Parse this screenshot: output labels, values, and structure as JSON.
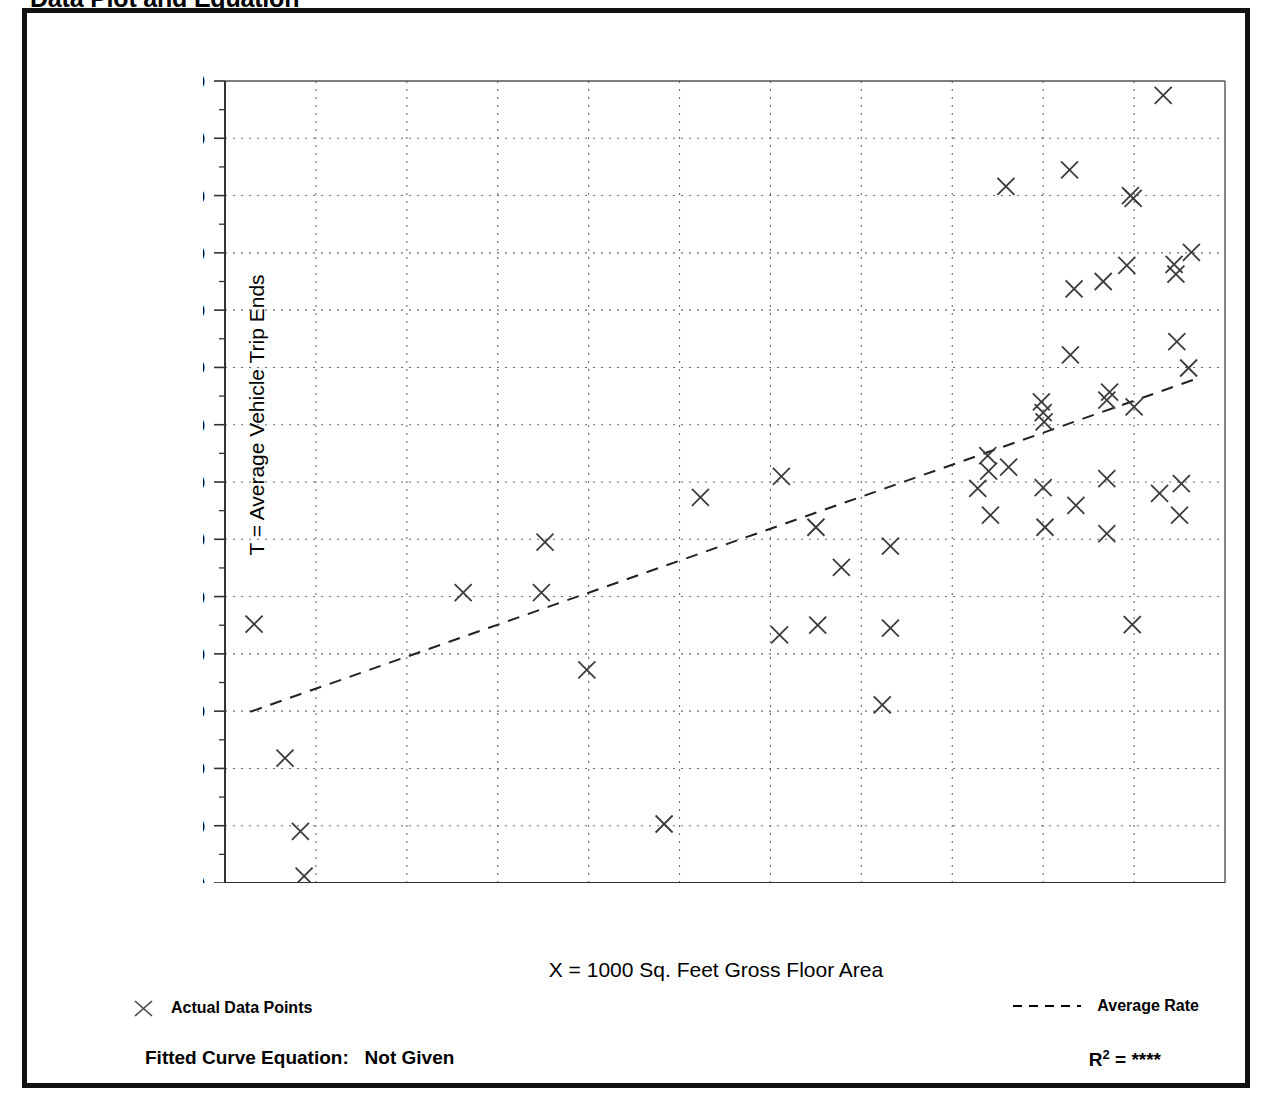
{
  "page": {
    "title": "Data Plot and Equation"
  },
  "legend": {
    "actual_marker": "x-marker-icon",
    "actual_label": "Actual Data Points",
    "average_marker": "dashed-line-icon",
    "average_label": "Average Rate"
  },
  "footer": {
    "fitted_equation_label": "Fitted Curve Equation:",
    "fitted_equation_value": "Not Given",
    "r_squared_symbol": "R",
    "r_squared_exponent": "2",
    "r_squared_equals": "=",
    "r_squared_value": "****"
  },
  "chart_data": {
    "type": "scatter",
    "title": "Data Plot and Equation",
    "xlabel": "X = 1000 Sq. Feet Gross Floor Area",
    "ylabel": "T = Average Vehicle Trip Ends",
    "xlim": [
      120,
      230
    ],
    "ylim": [
      400,
      1800
    ],
    "xticks": [
      120,
      130,
      140,
      150,
      160,
      170,
      180,
      190,
      200,
      210,
      220,
      230
    ],
    "xtick_labels": [
      "120",
      "130",
      "140",
      "150",
      "160",
      "170",
      "180",
      "190",
      "200",
      "210",
      "220",
      "230"
    ],
    "yticks": [
      400,
      500,
      600,
      700,
      800,
      900,
      1000,
      1100,
      1200,
      1300,
      1400,
      1500,
      1600,
      1700,
      1800
    ],
    "ytick_labels": [
      "400",
      "500",
      "600",
      "700",
      "800",
      "900",
      "1,000",
      "1,100",
      "1,200",
      "1,300",
      "1,400",
      "1,500",
      "1,600",
      "1,700",
      "1,800"
    ],
    "x_minor_tick_step": 5,
    "y_minor_tick_step": 50,
    "grid": true,
    "grid_style": "dotted",
    "legend_position": "below-plot",
    "series": [
      {
        "name": "Actual Data Points",
        "marker": "x",
        "points": [
          [
            123.2,
            852
          ],
          [
            126.6,
            618
          ],
          [
            128.3,
            490
          ],
          [
            128.7,
            412
          ],
          [
            146.2,
            907
          ],
          [
            154.8,
            907
          ],
          [
            155.2,
            995
          ],
          [
            159.8,
            772
          ],
          [
            168.3,
            503
          ],
          [
            172.3,
            1073
          ],
          [
            181.2,
            1110
          ],
          [
            181.0,
            833
          ],
          [
            185.0,
            1021
          ],
          [
            185.2,
            850
          ],
          [
            187.8,
            951
          ],
          [
            192.3,
            711
          ],
          [
            193.2,
            988
          ],
          [
            193.2,
            845
          ],
          [
            202.8,
            1089
          ],
          [
            203.9,
            1146
          ],
          [
            204.0,
            1119
          ],
          [
            204.2,
            1042
          ],
          [
            205.9,
            1616
          ],
          [
            206.2,
            1126
          ],
          [
            209.8,
            1240
          ],
          [
            210.0,
            1221
          ],
          [
            210.1,
            1205
          ],
          [
            210.0,
            1090
          ],
          [
            210.2,
            1021
          ],
          [
            212.9,
            1645
          ],
          [
            213.0,
            1322
          ],
          [
            213.4,
            1437
          ],
          [
            213.6,
            1059
          ],
          [
            216.6,
            1450
          ],
          [
            217.0,
            1243
          ],
          [
            217.3,
            1257
          ],
          [
            217.0,
            1106
          ],
          [
            217.0,
            1010
          ],
          [
            219.6,
            1600
          ],
          [
            219.9,
            1595
          ],
          [
            219.2,
            1478
          ],
          [
            220.0,
            1231
          ],
          [
            219.8,
            851
          ],
          [
            222.8,
            1080
          ],
          [
            223.2,
            1775
          ],
          [
            224.4,
            1480
          ],
          [
            224.6,
            1463
          ],
          [
            224.7,
            1345
          ],
          [
            225.2,
            1097
          ],
          [
            225.0,
            1042
          ],
          [
            226.0,
            1299
          ],
          [
            226.3,
            1501
          ]
        ]
      }
    ],
    "trendline": {
      "name": "Average Rate",
      "style": "dashed",
      "endpoints": [
        [
          122.8,
          699
        ],
        [
          227.0,
          1281
        ]
      ]
    }
  }
}
